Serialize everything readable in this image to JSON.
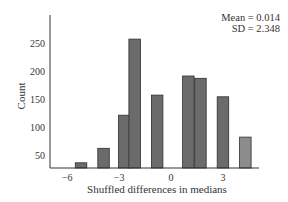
{
  "chart_data": {
    "type": "bar",
    "title": "",
    "xlabel": "Shuffled differences in medians",
    "ylabel": "Count",
    "x": [
      -5.2,
      -3.9,
      -2.7,
      -2.1,
      -0.8,
      1.0,
      1.7,
      3.0,
      4.3
    ],
    "values": [
      36,
      62,
      121,
      257,
      157,
      191,
      187,
      154,
      82
    ],
    "bar_colors": [
      "#6b6b6b",
      "#6b6b6b",
      "#6b6b6b",
      "#6b6b6b",
      "#6b6b6b",
      "#6b6b6b",
      "#6b6b6b",
      "#6b6b6b",
      "#8c8c8c"
    ],
    "xticks": [
      -6,
      -3,
      0,
      3
    ],
    "xtick_labels": [
      "−6",
      "−3",
      "0",
      "3"
    ],
    "yticks": [
      50,
      100,
      150,
      200,
      250
    ],
    "ytick_labels": [
      "50",
      "100",
      "150",
      "200",
      "250"
    ],
    "xlim": [
      -6.5,
      5.2
    ],
    "ylim": [
      27,
      300
    ],
    "grid": false,
    "annotations": [
      "Mean = 0.014",
      "SD = 2.348"
    ]
  },
  "stats": {
    "mean_label": "Mean = 0.014",
    "sd_label": "SD = 2.348"
  },
  "axes": {
    "x_title": "Shuffled differences in medians",
    "y_title": "Count"
  }
}
